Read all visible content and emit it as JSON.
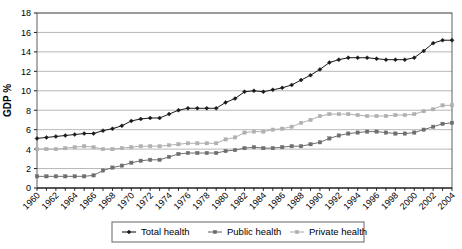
{
  "chart_data": {
    "type": "line",
    "title": "",
    "subtitle": "",
    "xlabel": "",
    "ylabel": "GDP  %",
    "ylim": [
      0,
      18
    ],
    "ytick_step": 2,
    "yticks": [
      "0",
      "2",
      "4",
      "6",
      "8",
      "10",
      "12",
      "14",
      "16",
      "18"
    ],
    "grid": true,
    "legend_position": "bottom",
    "x": [
      1960,
      1961,
      1962,
      1963,
      1964,
      1965,
      1966,
      1967,
      1968,
      1969,
      1970,
      1971,
      1972,
      1973,
      1974,
      1975,
      1976,
      1977,
      1978,
      1979,
      1980,
      1981,
      1982,
      1983,
      1984,
      1985,
      1986,
      1987,
      1988,
      1989,
      1990,
      1991,
      1992,
      1993,
      1994,
      1995,
      1996,
      1997,
      1998,
      1999,
      2000,
      2001,
      2002,
      2003,
      2004
    ],
    "xtick_labels": [
      "1960",
      "1962",
      "1964",
      "1966",
      "1968",
      "1970",
      "1972",
      "1974",
      "1976",
      "1978",
      "1980",
      "1982",
      "1984",
      "1986",
      "1988",
      "1990",
      "1992",
      "1994",
      "1996",
      "1998",
      "2000",
      "2002",
      "2004"
    ],
    "series": [
      {
        "name": "Total health",
        "color": "#1a1a1a",
        "marker": "diamond",
        "values": [
          5.1,
          5.2,
          5.3,
          5.4,
          5.5,
          5.6,
          5.6,
          5.9,
          6.1,
          6.4,
          6.9,
          7.1,
          7.2,
          7.2,
          7.6,
          8.0,
          8.2,
          8.2,
          8.2,
          8.2,
          8.8,
          9.2,
          9.9,
          10.0,
          9.9,
          10.1,
          10.3,
          10.6,
          11.1,
          11.6,
          12.2,
          12.9,
          13.2,
          13.4,
          13.4,
          13.4,
          13.3,
          13.2,
          13.2,
          13.2,
          13.4,
          14.1,
          14.9,
          15.2,
          15.2
        ]
      },
      {
        "name": "Public health",
        "color": "#6e6e6e",
        "marker": "square",
        "values": [
          1.2,
          1.2,
          1.2,
          1.2,
          1.2,
          1.2,
          1.3,
          1.8,
          2.1,
          2.3,
          2.6,
          2.8,
          2.9,
          2.9,
          3.2,
          3.5,
          3.6,
          3.6,
          3.6,
          3.6,
          3.8,
          3.9,
          4.1,
          4.2,
          4.1,
          4.1,
          4.2,
          4.3,
          4.3,
          4.5,
          4.7,
          5.1,
          5.4,
          5.6,
          5.7,
          5.8,
          5.8,
          5.7,
          5.6,
          5.6,
          5.7,
          6.0,
          6.3,
          6.6,
          6.7
        ]
      },
      {
        "name": "Private health",
        "color": "#b0b0b0",
        "marker": "square",
        "values": [
          4.0,
          4.0,
          4.0,
          4.1,
          4.2,
          4.3,
          4.2,
          4.0,
          4.0,
          4.1,
          4.2,
          4.3,
          4.3,
          4.3,
          4.4,
          4.5,
          4.6,
          4.6,
          4.6,
          4.6,
          5.0,
          5.2,
          5.7,
          5.8,
          5.8,
          6.0,
          6.1,
          6.3,
          6.7,
          7.0,
          7.4,
          7.6,
          7.6,
          7.6,
          7.5,
          7.4,
          7.4,
          7.4,
          7.5,
          7.5,
          7.6,
          7.9,
          8.1,
          8.5,
          8.5
        ]
      }
    ]
  },
  "legend": {
    "items": [
      {
        "label": "Total health"
      },
      {
        "label": "Public health"
      },
      {
        "label": "Private health"
      }
    ]
  }
}
